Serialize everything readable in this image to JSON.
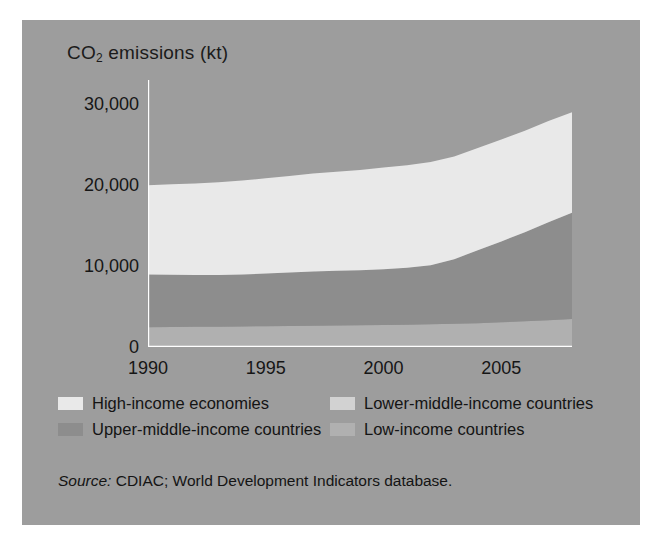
{
  "figure": {
    "background": "#9d9d9d",
    "title_main": "CO",
    "title_sub": "2",
    "title_rest": " emissions (kt)"
  },
  "source": {
    "label": "Source:",
    "text": " CDIAC; World Development Indicators database."
  },
  "legend": {
    "rows": [
      [
        {
          "label": "High-income economies",
          "color": "#e9e9e9"
        },
        {
          "label": "Lower-middle-income countries",
          "color": "#d2d2d2"
        }
      ],
      [
        {
          "label": "Upper-middle-income countries",
          "color": "#8d8d8d"
        },
        {
          "label": "Low-income countries",
          "color": "#b0b0b0"
        }
      ]
    ]
  },
  "chart_data": {
    "type": "area",
    "stacked": true,
    "title": "CO2 emissions (kt)",
    "xlabel": "",
    "ylabel": "CO2 emissions (kt)",
    "xlim": [
      1990,
      2008
    ],
    "ylim": [
      0,
      33000
    ],
    "yticks": [
      0,
      10000,
      20000,
      30000
    ],
    "ytick_labels": [
      "0",
      "10,000",
      "20,000",
      "30,000"
    ],
    "xticks": [
      1990,
      1991,
      1992,
      1993,
      1994,
      1995,
      1996,
      1997,
      1998,
      1999,
      2000,
      2001,
      2002,
      2003,
      2004,
      2005,
      2006,
      2007,
      2008
    ],
    "xtick_labels_shown": [
      "1990",
      "1995",
      "2000",
      "2005"
    ],
    "xtick_labels_shown_at": [
      1990,
      1995,
      2000,
      2005
    ],
    "grid": false,
    "legend_position": "below",
    "x": [
      1990,
      1991,
      1992,
      1993,
      1994,
      1995,
      1996,
      1997,
      1998,
      1999,
      2000,
      2001,
      2002,
      2003,
      2004,
      2005,
      2006,
      2007,
      2008
    ],
    "series": [
      {
        "name": "Low-income countries",
        "color": "#b0b0b0",
        "values": [
          2450,
          2470,
          2490,
          2510,
          2540,
          2570,
          2600,
          2630,
          2660,
          2690,
          2720,
          2760,
          2800,
          2860,
          2950,
          3050,
          3180,
          3320,
          3450
        ]
      },
      {
        "name": "Upper-middle-income countries",
        "color": "#8d8d8d",
        "values": [
          6500,
          6450,
          6400,
          6400,
          6430,
          6500,
          6600,
          6700,
          6750,
          6800,
          6900,
          7050,
          7300,
          8000,
          9000,
          10000,
          11000,
          12100,
          13150
        ]
      },
      {
        "name": "Lower-middle-income countries",
        "color": "#d2d2d2",
        "values": [
          0,
          0,
          0,
          0,
          0,
          0,
          0,
          0,
          0,
          0,
          0,
          0,
          0,
          0,
          0,
          0,
          0,
          0,
          0
        ]
      },
      {
        "name": "High-income economies",
        "color": "#e9e9e9",
        "values": [
          11050,
          11180,
          11310,
          11440,
          11600,
          11780,
          11950,
          12100,
          12250,
          12400,
          12550,
          12650,
          12750,
          12700,
          12650,
          12600,
          12550,
          12500,
          12400
        ]
      }
    ],
    "totals": [
      20000,
      20100,
      20200,
      20350,
      20570,
      20850,
      21150,
      21430,
      21660,
      21890,
      22170,
      22460,
      22850,
      23560,
      24600,
      25650,
      26730,
      27920,
      29000
    ]
  }
}
